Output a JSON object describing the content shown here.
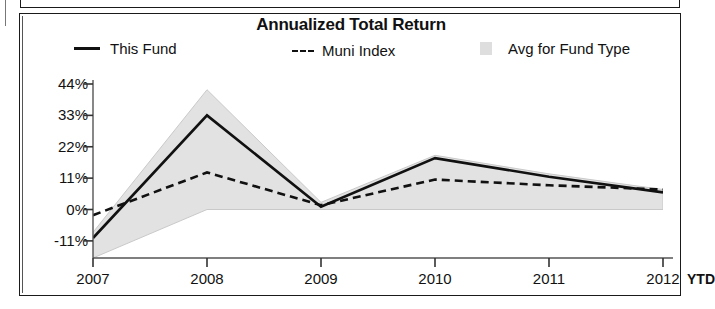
{
  "chart_data": {
    "type": "line",
    "title": "Annualized Total Return",
    "xlabel": "",
    "ylabel": "",
    "categories": [
      "2007",
      "2008",
      "2009",
      "2010",
      "2011",
      "2012"
    ],
    "ytd_label": "YTD",
    "ylim": [
      -17,
      44
    ],
    "yticks": [
      44,
      33,
      22,
      11,
      0,
      -11
    ],
    "ytick_labels": [
      "44%",
      "33%",
      "22%",
      "11%",
      "0%",
      "-11%"
    ],
    "grid": false,
    "legend_position": "top",
    "series": [
      {
        "name": "This Fund",
        "style": "solid",
        "color": "#111111",
        "values": [
          -10,
          33,
          1,
          18,
          11.5,
          6
        ]
      },
      {
        "name": "Muni Index",
        "style": "dashed",
        "color": "#111111",
        "values": [
          -2,
          13,
          1.5,
          10.5,
          8.5,
          7
        ]
      },
      {
        "name": "Avg for Fund Type",
        "style": "band",
        "color": "#e2e2e2",
        "band_upper": [
          -8,
          42,
          2.5,
          19,
          12.5,
          7
        ],
        "band_lower": [
          -17,
          0,
          0,
          0,
          0,
          0
        ]
      }
    ]
  },
  "legend": {
    "this_fund": "This Fund",
    "muni_index": "Muni Index",
    "avg_for_fund_type": "Avg for Fund Type"
  }
}
